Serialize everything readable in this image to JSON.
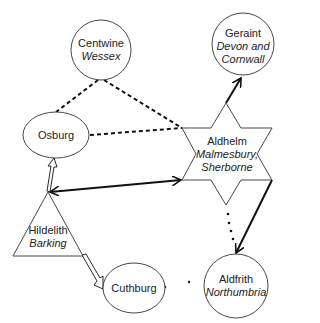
{
  "nodes": [
    {
      "id": "centwine",
      "name": "Centwine",
      "region": "Wessex",
      "shape": "circle"
    },
    {
      "id": "geraint",
      "name": "Geraint",
      "region": "Devon and Cornwall",
      "region_line1": "Devon and",
      "region_line2": "Cornwall",
      "shape": "circle"
    },
    {
      "id": "osburg",
      "name": "Osburg",
      "region": "",
      "shape": "ellipse"
    },
    {
      "id": "aldhelm",
      "name": "Aldhelm",
      "region": "Malmesbury, Sherborne",
      "region_line1": "Malmesbury,",
      "region_line2": "Sherborne",
      "shape": "star"
    },
    {
      "id": "hildelith",
      "name": "Hildelith",
      "region": "Barking",
      "shape": "triangle"
    },
    {
      "id": "cuthburg",
      "name": "Cuthburg",
      "region": "",
      "shape": "ellipse"
    },
    {
      "id": "aldfrith",
      "name": "Aldfrith",
      "region": "Northumbria",
      "shape": "circle"
    }
  ],
  "edges": [
    {
      "from": "centwine",
      "to": "osburg",
      "style": "dashed"
    },
    {
      "from": "centwine",
      "to": "aldhelm",
      "style": "dashed"
    },
    {
      "from": "osburg",
      "to": "aldhelm",
      "style": "dashed"
    },
    {
      "from": "aldhelm",
      "to": "geraint",
      "style": "solid-arrow"
    },
    {
      "from": "hildelith",
      "to": "aldhelm",
      "style": "double-arrow"
    },
    {
      "from": "hildelith",
      "to": "osburg",
      "style": "hollow-arrow"
    },
    {
      "from": "hildelith",
      "to": "cuthburg",
      "style": "hollow-arrow"
    },
    {
      "from": "aldhelm",
      "to": "aldfrith",
      "style": "solid-arrow"
    },
    {
      "from": "aldhelm",
      "to": "aldfrith",
      "style": "dotted"
    },
    {
      "from": "cuthburg",
      "to": "aldfrith",
      "style": "dotted"
    }
  ]
}
